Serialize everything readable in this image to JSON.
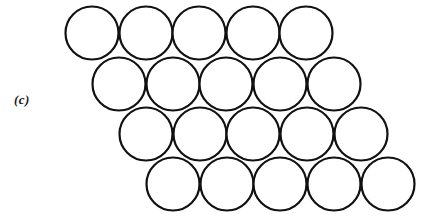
{
  "figure": {
    "panel_label": "(c)",
    "caption_text": "",
    "background_color": "#ffffff",
    "stroke_color": "#111111",
    "fill_color": "#ffffff",
    "stroke_width": 2.2,
    "canvas": {
      "width": 436,
      "height": 216
    }
  },
  "chart_data": {
    "type": "scatter",
    "title": "",
    "subtitle": "",
    "xlabel": "",
    "ylabel": "",
    "xlim": [
      0,
      436
    ],
    "ylim": [
      216,
      0
    ],
    "grid": false,
    "legend": null,
    "annotations": [
      "(c)"
    ],
    "marker": {
      "shape": "circle",
      "radius": 26.5,
      "diameter": 53,
      "facecolor": "#ffffff",
      "edgecolor": "#111111",
      "linewidth": 2.2
    },
    "layout": {
      "packing": "hexagonal-close-packed-layer",
      "rows": 4,
      "columns_per_row": 5,
      "total_circles": 20,
      "row_pitch_y": 50.5,
      "column_pitch_x": 53.5,
      "row_offset_x": 27
    },
    "rows": [
      {
        "row_index": 1,
        "center_y": 33,
        "centers_x": [
          92,
          146,
          199,
          253,
          306
        ]
      },
      {
        "row_index": 2,
        "center_y": 84,
        "centers_x": [
          119,
          173,
          226,
          280,
          334
        ]
      },
      {
        "row_index": 3,
        "center_y": 134,
        "centers_x": [
          146,
          200,
          253,
          307,
          361
        ]
      },
      {
        "row_index": 4,
        "center_y": 184,
        "centers_x": [
          173,
          227,
          280,
          334,
          388
        ]
      }
    ]
  }
}
